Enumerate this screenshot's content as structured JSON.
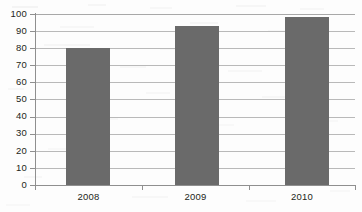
{
  "chart_data": {
    "type": "bar",
    "title": "",
    "subtitle": "",
    "xlabel": "",
    "ylabel": "",
    "categories": [
      "2008",
      "2009",
      "2010"
    ],
    "values": [
      80,
      93,
      98
    ],
    "series": [
      {
        "name": "",
        "values": [
          80,
          93,
          98
        ],
        "color": "#6a6a6a"
      }
    ],
    "ylim": [
      0,
      100
    ],
    "ytick_step": 10,
    "ytick_labels": [
      "100",
      "90",
      "80",
      "70",
      "60",
      "50",
      "40",
      "30",
      "20",
      "10",
      "0"
    ],
    "ytick_values": [
      100,
      90,
      80,
      70,
      60,
      50,
      40,
      30,
      20,
      10,
      0
    ],
    "grid": true,
    "grid_axis": "y",
    "legend": false,
    "legend_position": "none",
    "annotations": [],
    "colors": {
      "bar": "#6a6a6a",
      "gridline": "#b9b9b9",
      "axis": "#8f8f8f",
      "text": "#231f20",
      "background": "#fdfdfd"
    }
  },
  "bars": [
    {
      "category": "2008",
      "value": 80
    },
    {
      "category": "2009",
      "value": 93
    },
    {
      "category": "2010",
      "value": 98
    }
  ]
}
